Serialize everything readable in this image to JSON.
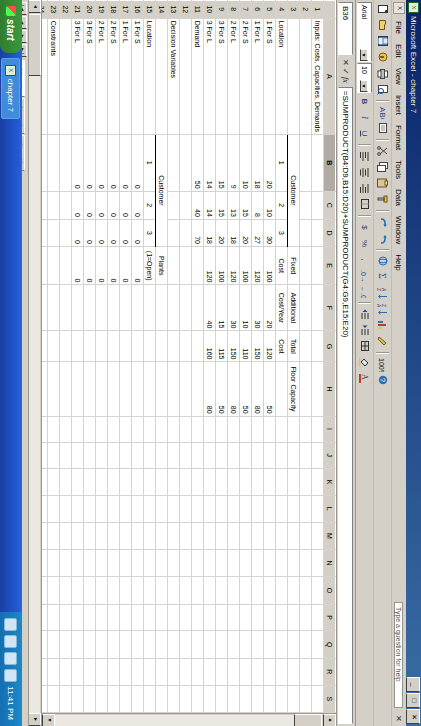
{
  "window": {
    "title": "Microsoft Excel - chapter 7",
    "icon": "excel-icon",
    "minimize": "_",
    "maximize": "□",
    "close": "✕"
  },
  "menu": {
    "items": [
      "File",
      "Edit",
      "View",
      "Insert",
      "Format",
      "Tools",
      "Data",
      "Window",
      "Help"
    ],
    "question_placeholder": "Type a question for help",
    "close_doc": "✕"
  },
  "toolbar": {
    "buttons": [
      "new-icon",
      "open-icon",
      "save-icon",
      "permission-icon",
      "print-icon",
      "print-preview-icon",
      "spelling-icon",
      "research-icon",
      "cut-icon",
      "copy-icon",
      "paste-icon",
      "format-painter-icon",
      "undo-icon",
      "redo-icon",
      "hyperlink-icon",
      "autosum-icon",
      "sort-asc-icon",
      "sort-desc-icon",
      "chart-icon",
      "drawing-icon",
      "zoom-icon",
      "help-icon"
    ]
  },
  "formatting": {
    "font_name": "Arial",
    "font_size": "10",
    "bold": "B",
    "italic": "I",
    "underline": "U",
    "align_left": "align-left-icon",
    "align_center": "align-center-icon",
    "align_right": "align-right-icon",
    "merge": "merge-cells-icon",
    "currency": "$",
    "percent": "%",
    "comma": ",",
    "inc_dec": "increase-decimal-icon",
    "dec_dec": "decrease-decimal-icon",
    "indent_dec": "decrease-indent-icon",
    "indent_inc": "increase-indent-icon",
    "borders": "borders-icon",
    "fill_color": "fill-color-icon",
    "font_color": "font-color-icon"
  },
  "formula_bar": {
    "name_box": "B36",
    "cancel": "✕",
    "enter": "✓",
    "fx": "fx",
    "formula": "=SUMPRODUCT(B4:D9,B15:D20)+SUMPRODUCT(G4:G9,E15:E20)"
  },
  "grid": {
    "columns": [
      "A",
      "B",
      "C",
      "D",
      "E",
      "F",
      "G",
      "H",
      "I",
      "J",
      "K",
      "L",
      "M",
      "N",
      "O",
      "P",
      "Q",
      "R",
      "S"
    ],
    "selected_column": "B",
    "selected_cell": "B36",
    "rows": [
      {
        "n": "1",
        "A": "Inputs: Costs, Capacities, Demands"
      },
      {
        "n": "2"
      },
      {
        "n": "3",
        "B": "Customer",
        "Bspan": 3,
        "Bclass": "c b uline",
        "E": "Fixed",
        "F": "Additional",
        "G": "Total",
        "H": "Floor Capacity",
        "hdr": true
      },
      {
        "n": "4",
        "A": "Location",
        "B": "1",
        "C": "2",
        "D": "3",
        "E": "Cost",
        "F": "Cost/Year",
        "G": "Cost",
        "hdr2": true
      },
      {
        "n": "5",
        "A": "1 For S",
        "B": "20",
        "C": "10",
        "D": "30",
        "E": "100",
        "F": "20",
        "G": "120",
        "H": "50"
      },
      {
        "n": "6",
        "A": "1 For L",
        "B": "18",
        "C": "8",
        "D": "27",
        "E": "120",
        "F": "30",
        "G": "150",
        "H": "80"
      },
      {
        "n": "7",
        "A": "2 For S",
        "B": "10",
        "C": "15",
        "D": "20",
        "E": "100",
        "F": "10",
        "G": "110",
        "H": "50"
      },
      {
        "n": "8",
        "A": "2 For L",
        "B": "9",
        "C": "13",
        "D": "18",
        "E": "120",
        "F": "30",
        "G": "150",
        "H": "80"
      },
      {
        "n": "9",
        "A": "3 For S",
        "B": "15",
        "C": "15",
        "D": "20",
        "E": "100",
        "F": "15",
        "G": "115",
        "H": "50"
      },
      {
        "n": "10",
        "A": "3 For L",
        "B": "14",
        "C": "14",
        "D": "18",
        "E": "120",
        "F": "40",
        "G": "160",
        "H": "80"
      },
      {
        "n": "11",
        "A": "Demand",
        "B": "50",
        "C": "40",
        "D": "70"
      },
      {
        "n": "12"
      },
      {
        "n": "13",
        "A": "Decision Variables"
      },
      {
        "n": "14",
        "B": "Customer",
        "E": "Plants"
      },
      {
        "n": "15",
        "A": "Location",
        "B": "1",
        "C": "2",
        "D": "3",
        "E": "(1=Open)"
      },
      {
        "n": "16",
        "A": "1 For S",
        "B": "0",
        "C": "0",
        "D": "0",
        "E": "0"
      },
      {
        "n": "17",
        "A": "1 For L",
        "B": "0",
        "C": "0",
        "D": "0",
        "E": "0"
      },
      {
        "n": "18",
        "A": "2 For S",
        "B": "0",
        "C": "0",
        "D": "0",
        "E": "0"
      },
      {
        "n": "19",
        "A": "2 For L",
        "B": "0",
        "C": "0",
        "D": "0",
        "E": "0"
      },
      {
        "n": "20",
        "A": "3 For S",
        "B": "0",
        "C": "0",
        "D": "0",
        "E": "0"
      },
      {
        "n": "21",
        "A": "3 For L",
        "B": "0",
        "C": "0",
        "D": "0",
        "E": "0"
      },
      {
        "n": "22"
      },
      {
        "n": "23",
        "A": "Constraints"
      },
      {
        "n": "24"
      },
      {
        "n": "25",
        "A": "Location",
        "B": "Excess Capacity"
      },
      {
        "n": "26",
        "A": "1 For S",
        "B": "0"
      },
      {
        "n": "27",
        "A": "1 For L",
        "B": "0"
      },
      {
        "n": "28",
        "A": "2 For S",
        "B": "0"
      },
      {
        "n": "29",
        "A": "2 For L",
        "B": "0"
      },
      {
        "n": "30",
        "A": "3 For S",
        "B": "0"
      },
      {
        "n": "31",
        "A": "3 For L",
        "B": "0"
      },
      {
        "n": "32"
      },
      {
        "n": "33",
        "B": "1",
        "C": "2",
        "D": "3"
      },
      {
        "n": "34",
        "A": "Unmet demand",
        "B": "50",
        "C": "40",
        "D": "70"
      },
      {
        "n": "35"
      },
      {
        "n": "36",
        "A": "Objective function"
      },
      {
        "n": "37",
        "A": "cost=",
        "B": ""
      },
      {
        "n": "38"
      }
    ]
  },
  "sheet_tabs": {
    "nav_first": "|◄",
    "nav_prev": "◄",
    "nav_next": "►",
    "nav_last": "►|",
    "tabs": [
      "Sheet1",
      "Sheet2",
      "Sheet3"
    ],
    "active": "Sheet1"
  },
  "status": {
    "mode": "Ready",
    "caps": "CAPS"
  },
  "taskbar": {
    "start": "start",
    "tasks": [
      {
        "label": "chapter 7",
        "icon": "excel-icon"
      }
    ],
    "tray_icons": [
      "network-icon",
      "volume-icon",
      "shield-icon",
      "update-icon"
    ],
    "clock": "11:41 PM"
  }
}
